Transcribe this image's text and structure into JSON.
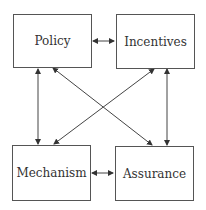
{
  "diagram": {
    "nodes": [
      {
        "id": "policy",
        "label": "Policy"
      },
      {
        "id": "incentives",
        "label": "Incentives"
      },
      {
        "id": "mechanism",
        "label": "Mechanism"
      },
      {
        "id": "assurance",
        "label": "Assurance"
      }
    ],
    "edges": [
      {
        "from": "policy",
        "to": "incentives",
        "direction": "bidirectional"
      },
      {
        "from": "mechanism",
        "to": "assurance",
        "direction": "bidirectional"
      },
      {
        "from": "policy",
        "to": "mechanism",
        "direction": "bidirectional"
      },
      {
        "from": "incentives",
        "to": "assurance",
        "direction": "bidirectional"
      },
      {
        "from": "policy",
        "to": "assurance",
        "direction": "bidirectional"
      },
      {
        "from": "incentives",
        "to": "mechanism",
        "direction": "bidirectional"
      }
    ],
    "colors": {
      "line": "#444444",
      "box_border": "#555555",
      "text": "#333333"
    }
  }
}
